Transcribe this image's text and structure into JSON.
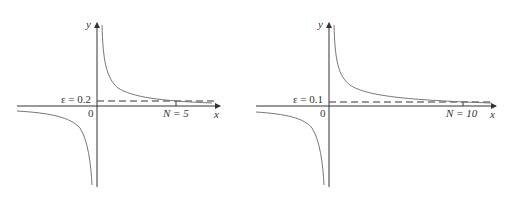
{
  "figures": [
    {
      "epsilon_label": "ε = 0.2",
      "n_label": "N = 5",
      "origin_label": "0",
      "x_axis_label": "x",
      "y_axis_label": "y",
      "epsilon": 0.2,
      "N": 5
    },
    {
      "epsilon_label": "ε = 0.1",
      "n_label": "N = 10",
      "origin_label": "0",
      "x_axis_label": "x",
      "y_axis_label": "y",
      "epsilon": 0.1,
      "N": 10
    }
  ],
  "colors": {
    "axis": "#333333",
    "curve": "#777777",
    "dash": "#333333"
  }
}
